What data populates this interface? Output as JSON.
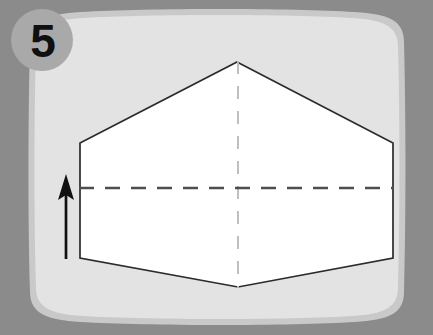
{
  "diagram": {
    "step_badge": {
      "label": "5",
      "shape": "circle",
      "fill_color": "#a9a9a9",
      "text_color": "#101010",
      "center": [
        42,
        40
      ],
      "radius": 31
    },
    "panel": {
      "name": "instruction-panel",
      "fill_color": "#e2e2e2",
      "border_color": "#c2c2c2",
      "shape": "rounded-barrel-rectangle",
      "bounds": [
        22,
        12,
        389,
        311
      ]
    },
    "background_color": "#8b8b8b",
    "paper": {
      "name": "hexagon-paper",
      "fill_color": "#ffffff",
      "stroke_color": "#2b2b2b",
      "stroke_width": 1.6,
      "shape": "hexagon",
      "vertices": [
        [
          237,
          62
        ],
        [
          393,
          143
        ],
        [
          393,
          258
        ],
        [
          238,
          287
        ],
        [
          80,
          258
        ],
        [
          80,
          143
        ]
      ]
    },
    "fold_lines": [
      {
        "name": "horizontal-fold-line",
        "orientation": "horizontal",
        "style": "dashed",
        "color": "#4a4a4a",
        "stroke_width": 2.4,
        "dash": "15 11",
        "from": [
          80,
          188
        ],
        "to": [
          393,
          188
        ]
      },
      {
        "name": "vertical-center-line",
        "orientation": "vertical",
        "style": "dashed",
        "color": "#b9b9b9",
        "stroke_width": 1.8,
        "dash": "13 12",
        "from": [
          238,
          62
        ],
        "to": [
          238,
          287
        ]
      }
    ],
    "arrow": {
      "name": "fold-direction-arrow",
      "direction": "up",
      "color": "#111111",
      "shaft_width": 2.6,
      "tail": [
        66,
        259
      ],
      "head": [
        66,
        176
      ],
      "head_width": 17,
      "head_length": 24
    }
  }
}
